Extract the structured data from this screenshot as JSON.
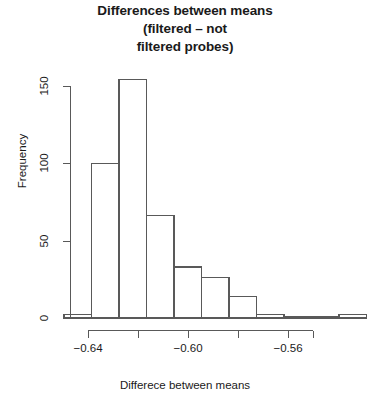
{
  "chart_data": {
    "type": "bar",
    "title_lines": [
      "Differences between means",
      "(filtered – not",
      "filtered probes)"
    ],
    "xlabel": "Differece between means",
    "ylabel": "Frequency",
    "grid": false,
    "legend": null,
    "xlim": [
      -0.6496,
      -0.5396
    ],
    "ylim": [
      0,
      160
    ],
    "bin_width": 0.011,
    "bin_edges": [
      -0.6496,
      -0.6386,
      -0.6276,
      -0.6166,
      -0.6056,
      -0.5946,
      -0.5836,
      -0.5726,
      -0.5616,
      -0.5506,
      -0.5396,
      -0.5286
    ],
    "categories": [
      "-0.650",
      "-0.639",
      "-0.628",
      "-0.617",
      "-0.606",
      "-0.595",
      "-0.584",
      "-0.573",
      "-0.562",
      "-0.551",
      "-0.540"
    ],
    "values": [
      2,
      100,
      154,
      66,
      33,
      26,
      14,
      2,
      0,
      0,
      2
    ],
    "xticks": [
      -0.64,
      -0.63,
      -0.62,
      -0.61,
      -0.6,
      -0.59,
      -0.58,
      -0.57,
      -0.56,
      -0.55
    ],
    "xtick_labels": [
      "−0.64",
      "−0.60",
      "−0.56"
    ],
    "xtick_label_values": [
      -0.64,
      -0.6,
      -0.56
    ],
    "yticks": [
      0,
      50,
      100,
      150
    ],
    "ytick_labels": [
      "0",
      "50",
      "100",
      "150"
    ],
    "colors": {
      "bar_fill": "#ffffff",
      "bar_stroke": "#595959",
      "axis": "#595959",
      "text": "#1a1a1a",
      "background": "#ffffff"
    }
  }
}
